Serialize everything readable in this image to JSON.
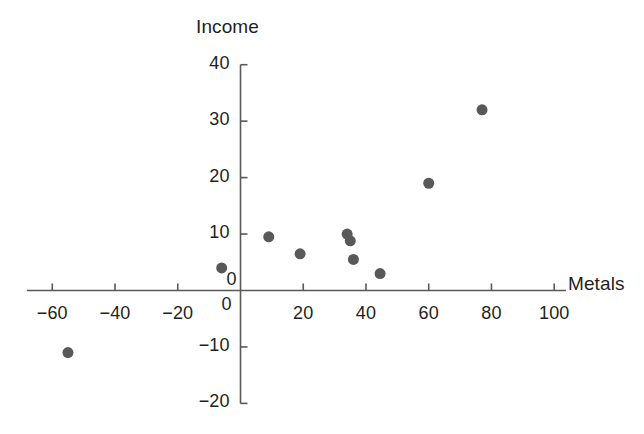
{
  "clipped_header_text": "",
  "chart_data": {
    "type": "scatter",
    "title": "",
    "xlabel": "Metals",
    "ylabel": "Income",
    "xlim": [
      -70,
      108
    ],
    "ylim": [
      -20,
      40
    ],
    "xticks": [
      -60,
      -40,
      -20,
      0,
      20,
      40,
      60,
      80,
      100
    ],
    "xtick_labels": [
      "−60",
      "−40",
      "−20",
      "0",
      "20",
      "40",
      "60",
      "80",
      "100"
    ],
    "yticks": [
      -20,
      -10,
      0,
      10,
      20,
      30,
      40
    ],
    "ytick_labels": [
      "−20",
      "−10",
      "0",
      "10",
      "20",
      "30",
      "40"
    ],
    "grid": false,
    "legend": null,
    "marker": {
      "shape": "circle",
      "color": "#595959",
      "size_px": 11
    },
    "axis_color": "#595959",
    "points": [
      {
        "x": -55,
        "y": -11
      },
      {
        "x": -6,
        "y": 4
      },
      {
        "x": 9,
        "y": 9.5
      },
      {
        "x": 19,
        "y": 6.5
      },
      {
        "x": 34,
        "y": 10
      },
      {
        "x": 35,
        "y": 8.8
      },
      {
        "x": 36,
        "y": 5.5
      },
      {
        "x": 44.5,
        "y": 3
      },
      {
        "x": 60,
        "y": 19
      },
      {
        "x": 77,
        "y": 32
      }
    ]
  }
}
